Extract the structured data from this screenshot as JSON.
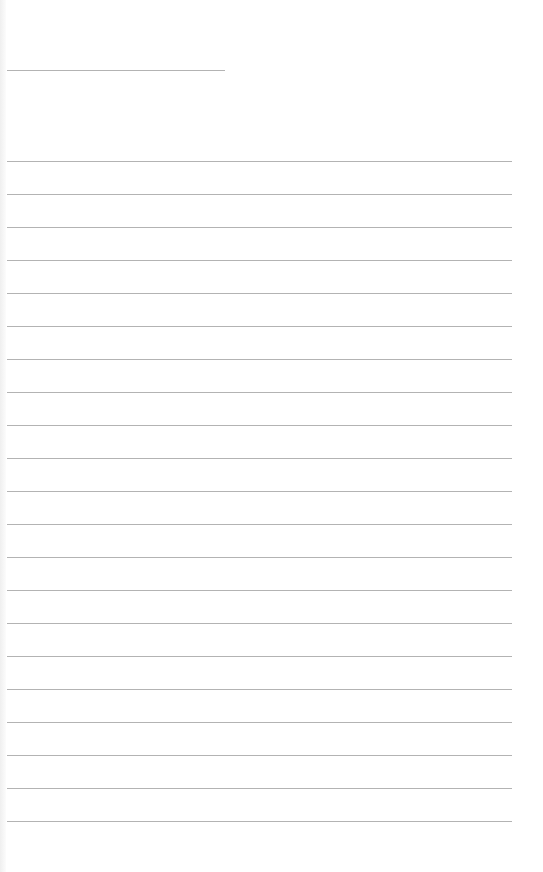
{
  "page": {
    "type": "lined-notebook-page",
    "title_line": {
      "top": 70,
      "left": 7,
      "width": 218
    },
    "rules": {
      "count": 21,
      "first_top": 161,
      "spacing": 33,
      "left": 7,
      "width": 505
    },
    "line_color": "#9a9a9a",
    "background": "#ffffff"
  }
}
